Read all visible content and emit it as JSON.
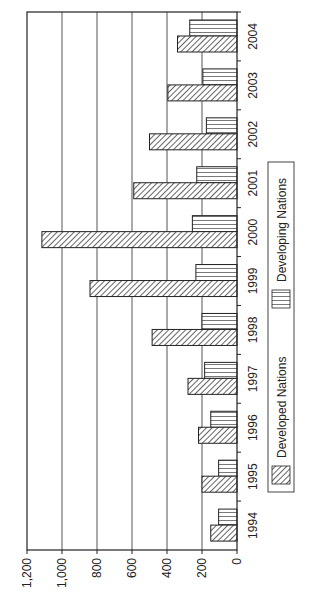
{
  "chart_data": {
    "type": "bar",
    "orientation": "rotated-90-clockwise",
    "title": "",
    "xlabel": "",
    "ylabel": "",
    "categories": [
      "1994",
      "1995",
      "1996",
      "1997",
      "1998",
      "1999",
      "2000",
      "2001",
      "2002",
      "2003",
      "2004"
    ],
    "series": [
      {
        "name": "Developed Nations",
        "pattern": "diagonal-hatch",
        "values": [
          150,
          200,
          220,
          280,
          485,
          840,
          1115,
          590,
          500,
          395,
          340
        ]
      },
      {
        "name": "Developing Nations",
        "pattern": "vertical-stripes",
        "values": [
          105,
          105,
          150,
          185,
          200,
          235,
          255,
          230,
          175,
          195,
          270
        ]
      }
    ],
    "ylim": [
      0,
      1200
    ],
    "yticks": [
      0,
      200,
      400,
      600,
      800,
      1000,
      1200
    ],
    "ytick_labels": [
      "0",
      "200",
      "400",
      "600",
      "800",
      "1,000",
      "1,200"
    ],
    "grid": true,
    "legend_placement": "bottom"
  },
  "colors": {
    "ink": "#222222",
    "grid": "#555555",
    "background": "#ffffff"
  }
}
